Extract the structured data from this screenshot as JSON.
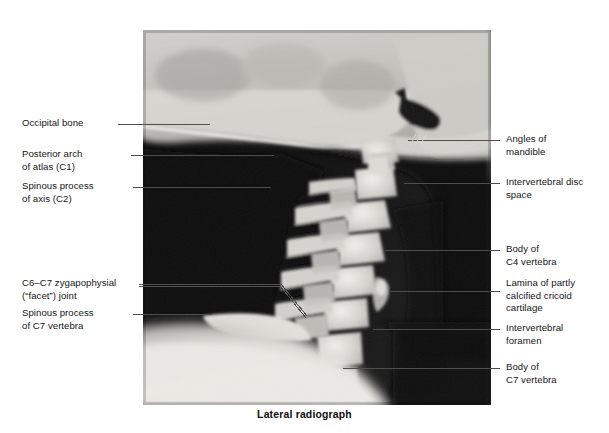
{
  "figure": {
    "caption": "Lateral radiograph",
    "image_name": "cervical-spine-lateral-radiograph"
  },
  "labels_left": [
    {
      "id": "occipital-bone",
      "lines": [
        "Occipital bone"
      ]
    },
    {
      "id": "posterior-arch-atlas",
      "lines": [
        "Posterior arch",
        "of atlas (C1)"
      ]
    },
    {
      "id": "spinous-process-axis",
      "lines": [
        "Spinous process",
        "of axis (C2)"
      ]
    },
    {
      "id": "c6-c7-zygapophysial-joint",
      "lines": [
        "C6–C7 zygapophysial",
        "(“facet”) joint"
      ]
    },
    {
      "id": "spinous-process-c7",
      "lines": [
        "Spinous process",
        "of C7 vertebra"
      ]
    }
  ],
  "labels_right": [
    {
      "id": "angles-of-mandible",
      "lines": [
        "Angles of",
        "mandible"
      ]
    },
    {
      "id": "intervertebral-disc-space",
      "lines": [
        "Intervertebral disc",
        "space"
      ]
    },
    {
      "id": "body-of-c4-vertebra",
      "lines": [
        "Body of",
        "C4 vertebra"
      ]
    },
    {
      "id": "lamina-cricoid-cartilage",
      "lines": [
        "Lamina of partly",
        "calcified cricoid",
        "cartilage"
      ]
    },
    {
      "id": "intervertebral-foramen",
      "lines": [
        "Intervertebral",
        "foramen"
      ]
    },
    {
      "id": "body-of-c7-vertebra",
      "lines": [
        "Body of",
        "C7 vertebra"
      ]
    }
  ],
  "colors": {
    "page_background": "#ffffff",
    "text": "#161616",
    "leader_line": "#4a4a4a",
    "plate_dark": "#0b0b0b",
    "bone_light": "#e8e6e2"
  }
}
